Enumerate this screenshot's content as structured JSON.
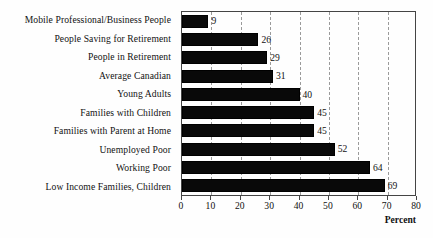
{
  "chart_data": {
    "type": "bar",
    "orientation": "horizontal",
    "title": "",
    "xlabel": "Percent",
    "ylabel": "",
    "xlim": [
      0,
      80
    ],
    "xticks": [
      0,
      10,
      20,
      30,
      40,
      50,
      60,
      70,
      80
    ],
    "grid": "vertical-dashed",
    "legend": "none",
    "categories": [
      "Mobile Professional/Business People",
      "People Saving for Retirement",
      "People in Retirement",
      "Average Canadian",
      "Young Adults",
      "Families with Children",
      "Families with Parent at Home",
      "Unemployed Poor",
      "Working Poor",
      "Low Income Families, Children"
    ],
    "values": [
      9,
      26,
      29,
      31,
      40,
      45,
      45,
      52,
      64,
      69
    ],
    "bar_color": "#090909",
    "grid_color": "#9a9a9a",
    "axis_color": "#444444",
    "background_color": "#fefefe"
  }
}
